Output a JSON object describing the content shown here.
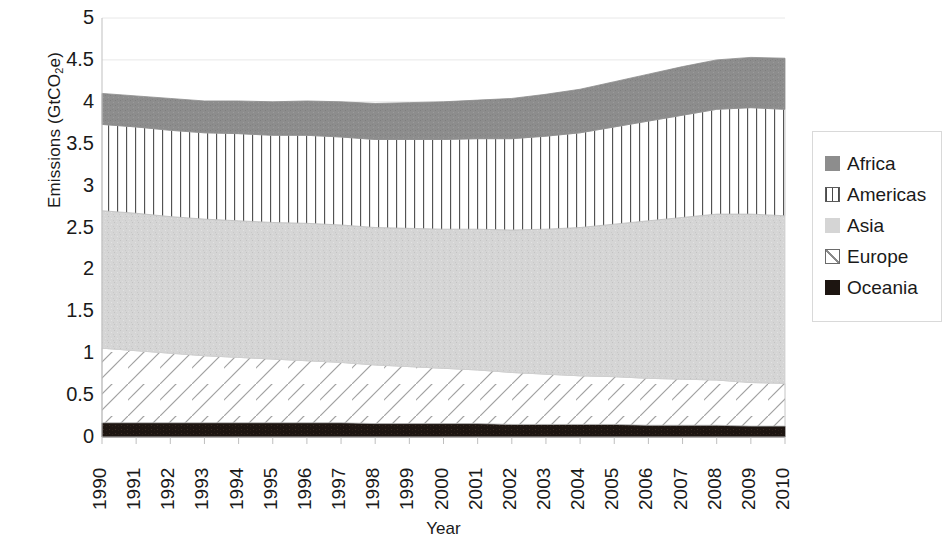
{
  "chart_data": {
    "type": "area",
    "title": "",
    "subtitle": "",
    "stacked": true,
    "xlabel": "Year",
    "ylabel": "Emissions (GtCO2e)",
    "ylabel_parts": {
      "prefix": "Emissions (GtCO",
      "sub": "2",
      "suffix": "e)"
    },
    "grid": true,
    "legend_position": "right",
    "xlim": [
      1990,
      2010
    ],
    "ylim": [
      0,
      5
    ],
    "ytick_step": 0.5,
    "ytick_labels": [
      "5",
      "4.5",
      "4",
      "3.5",
      "3",
      "2.5",
      "2",
      "1.5",
      "1",
      "0.5",
      "0"
    ],
    "ytick_values": [
      5,
      4.5,
      4,
      3.5,
      3,
      2.5,
      2,
      1.5,
      1,
      0.5,
      0
    ],
    "categories": [
      1990,
      1991,
      1992,
      1993,
      1994,
      1995,
      1996,
      1997,
      1998,
      1999,
      2000,
      2001,
      2002,
      2003,
      2004,
      2005,
      2006,
      2007,
      2008,
      2009,
      2010
    ],
    "xtick_labels": [
      "1990",
      "1991",
      "1992",
      "1993",
      "1994",
      "1995",
      "1996",
      "1997",
      "1998",
      "1999",
      "2000",
      "2001",
      "2002",
      "2003",
      "2004",
      "2005",
      "2006",
      "2007",
      "2008",
      "2009",
      "2010"
    ],
    "series": [
      {
        "name": "Oceania",
        "color": "#1c1410",
        "pattern": "solid",
        "values": [
          0.17,
          0.17,
          0.17,
          0.17,
          0.17,
          0.17,
          0.17,
          0.17,
          0.16,
          0.16,
          0.16,
          0.16,
          0.15,
          0.15,
          0.15,
          0.15,
          0.14,
          0.14,
          0.14,
          0.13,
          0.13
        ]
      },
      {
        "name": "Europe",
        "color": "#ffffff",
        "pattern": "diagonal-lines",
        "values": [
          0.89,
          0.86,
          0.83,
          0.8,
          0.78,
          0.76,
          0.74,
          0.72,
          0.7,
          0.68,
          0.66,
          0.64,
          0.62,
          0.6,
          0.58,
          0.57,
          0.56,
          0.55,
          0.54,
          0.52,
          0.51
        ]
      },
      {
        "name": "Asia",
        "color": "#d3d3d3",
        "pattern": "speckled",
        "values": [
          1.64,
          1.64,
          1.63,
          1.63,
          1.63,
          1.63,
          1.64,
          1.64,
          1.64,
          1.65,
          1.66,
          1.68,
          1.7,
          1.73,
          1.77,
          1.82,
          1.88,
          1.93,
          1.98,
          2.01,
          2.0
        ]
      },
      {
        "name": "Americas",
        "color": "#ffffff",
        "pattern": "vertical-lines",
        "values": [
          1.03,
          1.03,
          1.03,
          1.03,
          1.04,
          1.04,
          1.05,
          1.05,
          1.05,
          1.06,
          1.07,
          1.08,
          1.09,
          1.11,
          1.13,
          1.16,
          1.19,
          1.22,
          1.25,
          1.27,
          1.27
        ]
      },
      {
        "name": "Africa",
        "color": "#8b8b8b",
        "pattern": "solid",
        "values": [
          0.37,
          0.37,
          0.38,
          0.38,
          0.39,
          0.4,
          0.41,
          0.42,
          0.43,
          0.44,
          0.45,
          0.46,
          0.48,
          0.5,
          0.52,
          0.54,
          0.56,
          0.58,
          0.59,
          0.6,
          0.61
        ]
      }
    ],
    "totals": [
      4.1,
      4.07,
      4.04,
      4.01,
      4.01,
      4.0,
      4.01,
      4.0,
      3.98,
      3.99,
      4.0,
      4.02,
      4.04,
      4.09,
      4.15,
      4.24,
      4.33,
      4.42,
      4.5,
      4.53,
      4.52
    ]
  },
  "legend": {
    "items": [
      {
        "label": "Africa",
        "swatch": "legend-swatch-africa"
      },
      {
        "label": "Americas",
        "swatch": "legend-swatch-americas"
      },
      {
        "label": "Asia",
        "swatch": "legend-swatch-asia"
      },
      {
        "label": "Europe",
        "swatch": "legend-swatch-europe"
      },
      {
        "label": "Oceania",
        "swatch": "legend-swatch-oceania"
      }
    ]
  },
  "colors": {
    "africa": "#8b8b8b",
    "americas_lines": "#555555",
    "asia": "#d3d3d3",
    "europe_lines": "#9a9a9a",
    "oceania": "#1c1410",
    "gridline": "#e8e8e8",
    "axis": "#bfbfbf",
    "text": "#1a1a1a"
  }
}
